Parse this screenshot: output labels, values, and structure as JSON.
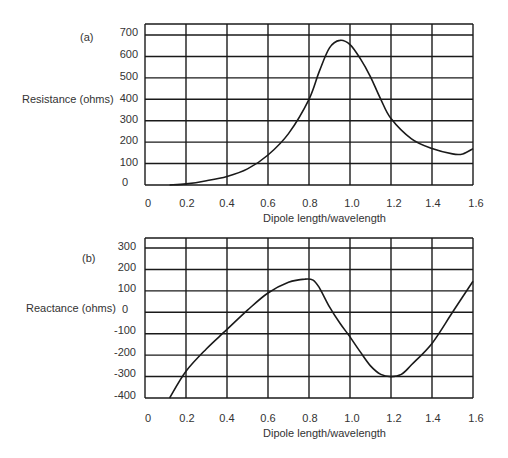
{
  "chart_data": [
    {
      "panel": "(a)",
      "type": "line",
      "title": "",
      "xlabel": "Dipole length/wavelength",
      "ylabel": "Resistance (ohms)",
      "xlim": [
        0,
        1.6
      ],
      "ylim": [
        0,
        700
      ],
      "grid": true,
      "legend": "none",
      "xticks": [
        "0",
        "0.2",
        "0.4",
        "0.6",
        "0.8",
        "1.0",
        "1.2",
        "1.4",
        "1.6"
      ],
      "yticks": [
        "700",
        "600",
        "500",
        "400",
        "300",
        "200",
        "100",
        "0"
      ],
      "series": [
        {
          "name": "Resistance",
          "x": [
            0.12,
            0.2,
            0.3,
            0.4,
            0.5,
            0.6,
            0.7,
            0.8,
            0.85,
            0.9,
            0.95,
            1.0,
            1.05,
            1.1,
            1.15,
            1.2,
            1.3,
            1.4,
            1.5,
            1.55,
            1.6
          ],
          "y": [
            0,
            5,
            20,
            40,
            75,
            140,
            240,
            400,
            530,
            640,
            675,
            655,
            590,
            505,
            400,
            310,
            215,
            170,
            145,
            145,
            170
          ]
        }
      ]
    },
    {
      "panel": "(b)",
      "type": "line",
      "title": "",
      "xlabel": "Dipole length/wavelength",
      "ylabel": "Reactance (ohms)",
      "xlim": [
        0,
        1.6
      ],
      "ylim": [
        -400,
        300
      ],
      "grid": true,
      "legend": "none",
      "xticks": [
        "0",
        "0.2",
        "0.4",
        "0.6",
        "0.8",
        "1.0",
        "1.2",
        "1.4",
        "1.6"
      ],
      "yticks": [
        "300",
        "200",
        "100",
        "0",
        "-100",
        "-200",
        "-300",
        "-400"
      ],
      "series": [
        {
          "name": "Reactance",
          "x": [
            0.12,
            0.2,
            0.3,
            0.4,
            0.5,
            0.6,
            0.7,
            0.78,
            0.82,
            0.85,
            0.9,
            0.95,
            1.0,
            1.05,
            1.1,
            1.15,
            1.2,
            1.25,
            1.3,
            1.4,
            1.5,
            1.6
          ],
          "y": [
            -400,
            -275,
            -170,
            -80,
            10,
            90,
            140,
            155,
            150,
            115,
            25,
            -50,
            -115,
            -185,
            -250,
            -290,
            -300,
            -290,
            -245,
            -145,
            0,
            145
          ]
        }
      ]
    }
  ],
  "panels": {
    "a": {
      "label": "(a)",
      "ylabel": "Resistance (ohms)",
      "xlabel": "Dipole length/wavelength",
      "yticks": [
        "700",
        "600",
        "500",
        "400",
        "300",
        "200",
        "100",
        "0"
      ],
      "xticks": [
        "0",
        "0.2",
        "0.4",
        "0.6",
        "0.8",
        "1.0",
        "1.2",
        "1.4",
        "1.6"
      ]
    },
    "b": {
      "label": "(b)",
      "ylabel": "Reactance (ohms)",
      "xlabel": "Dipole length/wavelength",
      "yticks": [
        "300",
        "200",
        "100",
        "0",
        "-100",
        "-200",
        "-300",
        "-400"
      ],
      "xticks": [
        "0",
        "0.2",
        "0.4",
        "0.6",
        "0.8",
        "1.0",
        "1.2",
        "1.4",
        "1.6"
      ]
    }
  },
  "colors": {
    "line": "#1a1a1a",
    "grid": "#1a1a1a",
    "text": "#333333",
    "background": "#ffffff"
  }
}
